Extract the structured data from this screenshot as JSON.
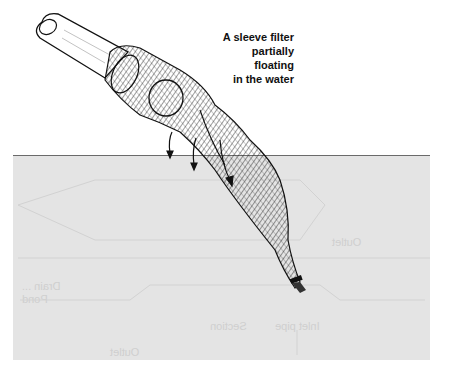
{
  "figure": {
    "caption_lines": [
      "A sleeve filter",
      "partially",
      "floating",
      "in the water"
    ],
    "components": {
      "pipe": "inlet-pipe",
      "filter": "sleeve-filter-net",
      "water": "water-surface",
      "flow": "water-flow-arrows",
      "tie": "filter-end-tie"
    },
    "bleed_through_text": [
      "Outlet",
      "Drain ...",
      "Pond",
      "Section",
      "Inlet pipe",
      "Outlet"
    ]
  },
  "colors": {
    "water": "#e4e4e4",
    "surface_line": "#6a6a6a",
    "ink": "#111111"
  }
}
